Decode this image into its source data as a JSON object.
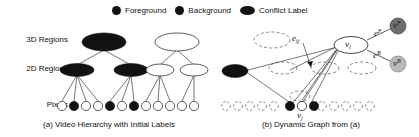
{
  "figure": {
    "legend": {
      "items": [
        {
          "label": "Foreground",
          "marker": "filled-circle-dark",
          "color": "#111111"
        },
        {
          "label": "Background",
          "marker": "filled-circle-dark",
          "color": "#111111"
        },
        {
          "label": "Conflict Label",
          "marker": "filled-ellipse-dark",
          "color": "#111111"
        }
      ]
    },
    "panel_a": {
      "caption": "(a) Video Hierarchy with Initial Labels",
      "row_labels": {
        "level3": "3D Regions",
        "level2": "2D Regions",
        "level1": "Pixels"
      },
      "levels": [
        {
          "name": "3D Regions",
          "shape": "ellipse",
          "nodes": [
            "dark",
            "white"
          ]
        },
        {
          "name": "2D Regions",
          "shape": "ellipse",
          "nodes": [
            "dark",
            "dark",
            "white",
            "white"
          ]
        },
        {
          "name": "Pixels",
          "shape": "circle",
          "nodes": [
            "white",
            "dark",
            "white",
            "white",
            "dark",
            "white",
            "dark",
            "white",
            "white",
            "white",
            "white",
            "white"
          ]
        }
      ]
    },
    "panel_b": {
      "caption": "(b) Dynamic Graph from (a)",
      "nodes": [
        {
          "id": "v_i",
          "label": "v",
          "sub": "i",
          "style": "solid-ellipse-white"
        },
        {
          "id": "v_j",
          "label": "v",
          "sub": "j",
          "style": "solid-circle-white"
        },
        {
          "id": "v_F",
          "label": "v",
          "sup": "F",
          "style": "filled-circle-darkgray"
        },
        {
          "id": "v_B",
          "label": "v",
          "sup": "B",
          "style": "filled-circle-lightgray"
        },
        {
          "id": "conflict",
          "label": "",
          "style": "filled-ellipse-dark"
        }
      ],
      "edges": [
        {
          "id": "e_ij",
          "label": "e",
          "sub": "ij",
          "from": "v_j",
          "to": "v_i"
        },
        {
          "id": "e_F",
          "label": "e",
          "sup": "F",
          "from": "v_i",
          "to": "v_F"
        },
        {
          "id": "e_B",
          "label": "e",
          "sup": "B",
          "from": "v_i",
          "to": "v_B"
        }
      ]
    },
    "colors": {
      "foreground": "#111111",
      "background": "#ffffff",
      "conflict": "#111111",
      "vF": "#6e6e6e",
      "vB": "#b8b8b8",
      "stroke": "#1a1a1a"
    }
  }
}
